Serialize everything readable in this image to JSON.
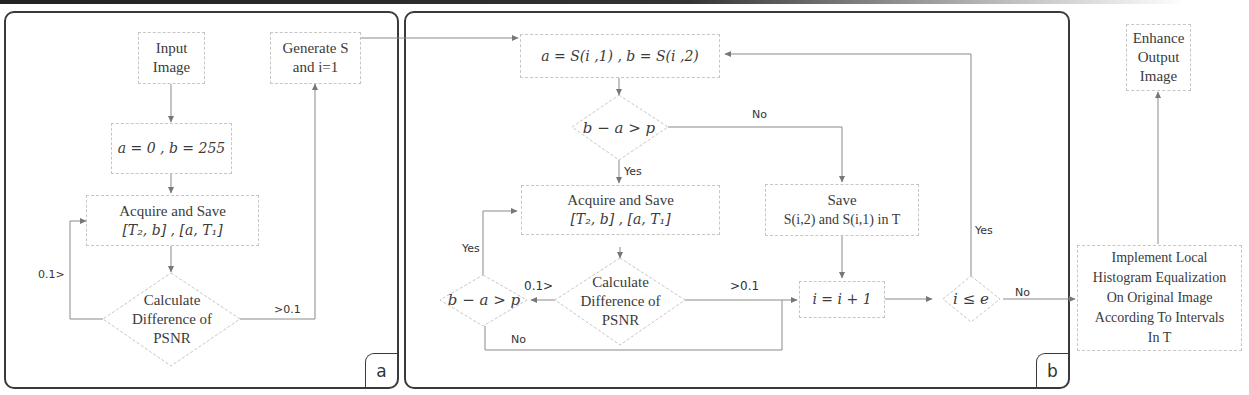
{
  "panels": {
    "a": {
      "tag": "a",
      "nodes": {
        "input_image": [
          "Input",
          "Image"
        ],
        "init_ab": "a = 0 , b = 255",
        "acquire_save": [
          "Acquire and Save",
          "[T₂, b] , [a, T₁]"
        ],
        "calc_psnr": [
          "Calculate",
          "Difference of",
          "PSNR"
        ],
        "generate_s": [
          "Generate S",
          "and i=1"
        ]
      },
      "edge_labels": {
        "loop_back": "0.1>",
        "forward": ">0.1"
      }
    },
    "b": {
      "tag": "b",
      "nodes": {
        "assign_ab": "a = S(i ,1) ,  b = S(i ,2)",
        "check_width": "b − a > p",
        "acquire_save": [
          "Acquire and Save",
          "[T₂, b] , [a, T₁]"
        ],
        "calc_psnr": [
          "Calculate",
          "Difference of",
          "PSNR"
        ],
        "check_width_2": "b − a > p",
        "save_t": [
          "Save",
          "S(i,2) and S(i,1) in T"
        ],
        "increment": "i = i + 1",
        "check_i": "i ≤ e"
      },
      "edge_labels": {
        "no_top": "No",
        "yes_down": "Yes",
        "yes_left": "Yes",
        "lt_0_1": "0.1>",
        "gt_0_1": ">0.1",
        "no_bottom": "No",
        "yes_loop": "Yes",
        "no_exit": "No"
      }
    }
  },
  "external": {
    "enhance_output": [
      "Enhance",
      "Output",
      "Image"
    ],
    "implement_lhe": [
      "Implement Local",
      "Histogram Equalization",
      "On Original Image",
      "According To Intervals",
      "In T"
    ]
  },
  "colors": {
    "panel_border": "#3a3a3a",
    "box_border": "#c6c6c6",
    "connector": "#777777",
    "text": "#3b3b3b"
  }
}
